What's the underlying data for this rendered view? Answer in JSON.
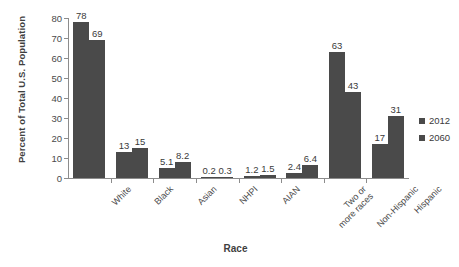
{
  "chart_data": {
    "type": "bar",
    "title": "",
    "subtitle": "",
    "xlabel": "Race",
    "ylabel": "Percent of Total U.S. Population",
    "ylim": [
      0,
      80
    ],
    "ytick_values": [
      0,
      10,
      20,
      30,
      40,
      50,
      60,
      70,
      80
    ],
    "ytick_labels": [
      "0",
      "10",
      "20",
      "30",
      "40",
      "50",
      "60",
      "70",
      "80"
    ],
    "grid": false,
    "legend_position": "right",
    "bar_color": "#4a4a4a",
    "axis_color": "#8c8c8c",
    "categories": [
      "White",
      "Black",
      "Asian",
      "NHPI",
      "AIAN",
      "Two or\nmore races",
      "Non-Hispanic",
      "Hispanic"
    ],
    "category_lines": [
      [
        "White"
      ],
      [
        "Black"
      ],
      [
        "Asian"
      ],
      [
        "NHPI"
      ],
      [
        "AIAN"
      ],
      [
        "Two or",
        "more races"
      ],
      [
        "Non-Hispanic"
      ],
      [
        "Hispanic"
      ]
    ],
    "series": [
      {
        "name": "2012",
        "values": [
          78,
          13,
          5.1,
          0.2,
          1.2,
          2.4,
          63,
          17
        ],
        "value_labels": [
          "78",
          "13",
          "5.1",
          "0.2",
          "1.2",
          "2.4",
          "63",
          "17"
        ]
      },
      {
        "name": "2060",
        "values": [
          69,
          15,
          8.2,
          0.3,
          1.5,
          6.4,
          43,
          31
        ],
        "value_labels": [
          "69",
          "15",
          "8.2",
          "0.3",
          "1.5",
          "6.4",
          "43",
          "31"
        ]
      }
    ]
  },
  "legend": {
    "items": [
      {
        "label": "2012",
        "color": "#4a4a4a"
      },
      {
        "label": "2060",
        "color": "#4a4a4a"
      }
    ]
  }
}
